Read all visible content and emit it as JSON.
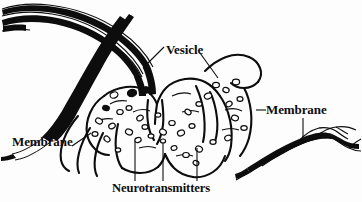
{
  "figure": {
    "background_color": "#fdfdfd",
    "ink_color": "#0d0d0d",
    "width": 362,
    "height": 202,
    "labels": [
      {
        "id": "vesicle",
        "text": "Vesicle"
      },
      {
        "id": "membrane_left",
        "text": "Membrane"
      },
      {
        "id": "membrane_right",
        "text": "Membrane"
      },
      {
        "id": "neurotransmitters",
        "text": "Neurotransmitters"
      }
    ]
  },
  "diagram_parts": {
    "presynaptic_axon_label": "presynaptic axon arc",
    "synaptic_terminal_label": "synaptic terminal bouton",
    "postsynaptic_membrane_label": "postsynaptic membrane band",
    "vesicle_count_visible": 34
  }
}
